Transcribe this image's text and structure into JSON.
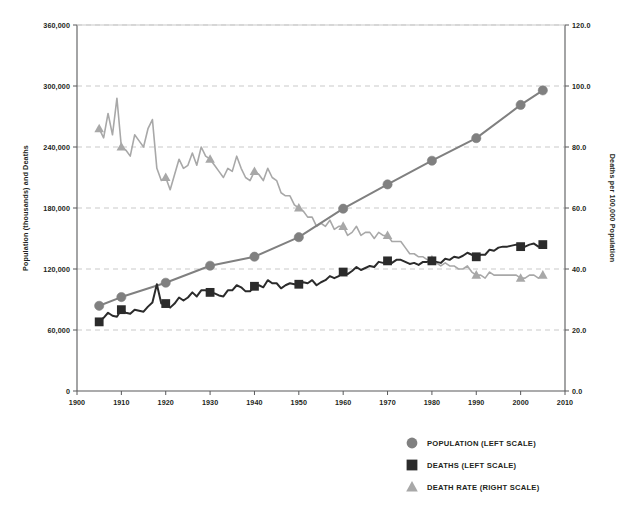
{
  "figure": {
    "title_fragment": "",
    "background": "#ffffff"
  },
  "colors": {
    "population": "#808080",
    "deaths": "#2b2b2b",
    "death_rate": "#a8a8a8",
    "grid": "#c9c9c9",
    "axis": "#58595b",
    "text": "#231f20"
  },
  "axes": {
    "left": {
      "title": "Population (thousands) and Deaths",
      "ticks": [
        "0",
        "60,000",
        "120,000",
        "180,000",
        "240,000",
        "300,000",
        "360,000"
      ],
      "min": 0,
      "max": 360000
    },
    "right": {
      "title": "Deaths per 100,000 Population",
      "ticks": [
        "0.0",
        "20.0",
        "40.0",
        "60.0",
        "80.0",
        "100.0",
        "120.0"
      ],
      "min": 0,
      "max": 120
    },
    "bottom": {
      "title": "",
      "ticks": [
        "1900",
        "1910",
        "1920",
        "1930",
        "1940",
        "1950",
        "1960",
        "1970",
        "1980",
        "1990",
        "2000",
        "2010"
      ],
      "min": 1900,
      "max": 2010
    }
  },
  "legend": {
    "items": [
      {
        "label": "POPULATION (LEFT SCALE)",
        "marker": "circle-marker",
        "color": "#808080"
      },
      {
        "label": "DEATHS (LEFT SCALE)",
        "marker": "square-marker",
        "color": "#2b2b2b"
      },
      {
        "label": "DEATH RATE (RIGHT SCALE)",
        "marker": "triangle-marker",
        "color": "#a8a8a8"
      }
    ]
  },
  "chart_data": {
    "type": "line",
    "title": "",
    "xlabel": "",
    "ylabel": "Population (thousands) and Deaths",
    "y2label": "Deaths per 100,000 Population",
    "xlim": [
      1900,
      2010
    ],
    "ylim": [
      0,
      360000
    ],
    "y2lim": [
      0,
      120
    ],
    "grid": true,
    "legend_position": "bottom-right",
    "marker_years": [
      1905,
      1910,
      1920,
      1930,
      1940,
      1950,
      1960,
      1970,
      1980,
      1990,
      2000,
      2005
    ],
    "series": [
      {
        "name": "POPULATION (LEFT SCALE)",
        "axis": "left",
        "units": "thousands",
        "marker": "circle-marker",
        "color": "#808080",
        "x": [
          1905,
          1910,
          1920,
          1930,
          1940,
          1950,
          1960,
          1970,
          1980,
          1990,
          2000,
          2005
        ],
        "values": [
          83800,
          92400,
          106500,
          123200,
          132100,
          151300,
          179300,
          203200,
          226500,
          248700,
          281400,
          295700
        ]
      },
      {
        "name": "DEATHS (LEFT SCALE)",
        "axis": "left",
        "units": "deaths",
        "marker": "square-marker",
        "color": "#2b2b2b",
        "x": [
          1905,
          1906,
          1907,
          1908,
          1909,
          1910,
          1911,
          1912,
          1913,
          1914,
          1915,
          1916,
          1917,
          1918,
          1919,
          1920,
          1921,
          1922,
          1923,
          1924,
          1925,
          1926,
          1927,
          1928,
          1929,
          1930,
          1931,
          1932,
          1933,
          1934,
          1935,
          1936,
          1937,
          1938,
          1939,
          1940,
          1941,
          1942,
          1943,
          1944,
          1945,
          1946,
          1947,
          1948,
          1949,
          1950,
          1951,
          1952,
          1953,
          1954,
          1955,
          1956,
          1957,
          1958,
          1959,
          1960,
          1961,
          1962,
          1963,
          1964,
          1965,
          1966,
          1967,
          1968,
          1969,
          1970,
          1971,
          1972,
          1973,
          1974,
          1975,
          1976,
          1977,
          1978,
          1979,
          1980,
          1981,
          1982,
          1983,
          1984,
          1985,
          1986,
          1987,
          1988,
          1989,
          1990,
          1991,
          1992,
          1993,
          1994,
          1995,
          1996,
          1997,
          1998,
          1999,
          2000,
          2001,
          2002,
          2003,
          2004,
          2005
        ],
        "values": [
          68000,
          72000,
          77000,
          74000,
          73000,
          80000,
          77000,
          76000,
          80000,
          79000,
          78000,
          83000,
          87000,
          105000,
          86000,
          86000,
          82000,
          86000,
          92000,
          89000,
          92000,
          97000,
          93000,
          99000,
          99000,
          97000,
          96000,
          94000,
          93000,
          99000,
          99000,
          104000,
          102000,
          98000,
          98000,
          103000,
          104000,
          102000,
          109000,
          106000,
          106000,
          101000,
          104000,
          106000,
          105000,
          105000,
          107000,
          106000,
          109000,
          104000,
          107000,
          109000,
          113000,
          111000,
          113000,
          117000,
          115000,
          118000,
          122000,
          119000,
          121000,
          123000,
          122000,
          127000,
          126000,
          128000,
          126000,
          129000,
          129000,
          127000,
          125000,
          126000,
          124000,
          127000,
          127000,
          128000,
          127000,
          126000,
          130000,
          129000,
          132000,
          131000,
          133000,
          136000,
          134000,
          132000,
          134000,
          134000,
          139000,
          138000,
          141000,
          142000,
          142000,
          143000,
          144000,
          142000,
          142000,
          144000,
          145000,
          142000,
          144000
        ]
      },
      {
        "name": "DEATH RATE (RIGHT SCALE)",
        "axis": "right",
        "units": "deaths per 100,000 population",
        "marker": "triangle-marker",
        "color": "#a8a8a8",
        "x": [
          1905,
          1906,
          1907,
          1908,
          1909,
          1910,
          1911,
          1912,
          1913,
          1914,
          1915,
          1916,
          1917,
          1918,
          1919,
          1920,
          1921,
          1922,
          1923,
          1924,
          1925,
          1926,
          1927,
          1928,
          1929,
          1930,
          1931,
          1932,
          1933,
          1934,
          1935,
          1936,
          1937,
          1938,
          1939,
          1940,
          1941,
          1942,
          1943,
          1944,
          1945,
          1946,
          1947,
          1948,
          1949,
          1950,
          1951,
          1952,
          1953,
          1954,
          1955,
          1956,
          1957,
          1958,
          1959,
          1960,
          1961,
          1962,
          1963,
          1964,
          1965,
          1966,
          1967,
          1968,
          1969,
          1970,
          1971,
          1972,
          1973,
          1974,
          1975,
          1976,
          1977,
          1978,
          1979,
          1980,
          1981,
          1982,
          1983,
          1984,
          1985,
          1986,
          1987,
          1988,
          1989,
          1990,
          1991,
          1992,
          1993,
          1994,
          1995,
          1996,
          1997,
          1998,
          1999,
          2000,
          2001,
          2002,
          2003,
          2004,
          2005
        ],
        "values": [
          86.0,
          83.0,
          91.0,
          84.0,
          96.0,
          80.0,
          79.0,
          77.0,
          84.0,
          82.0,
          80.0,
          86.0,
          89.0,
          73.0,
          69.0,
          70.0,
          66.0,
          71.0,
          76.0,
          73.0,
          74.0,
          78.0,
          74.0,
          80.0,
          77.0,
          76.0,
          74.0,
          72.0,
          70.0,
          73.0,
          72.0,
          77.0,
          73.0,
          70.0,
          69.0,
          72.0,
          71.0,
          69.0,
          73.0,
          70.0,
          69.0,
          65.0,
          64.0,
          64.0,
          61.0,
          60.0,
          59.0,
          57.0,
          57.0,
          54.0,
          55.0,
          54.0,
          56.0,
          53.0,
          54.0,
          54.0,
          51.0,
          52.0,
          54.0,
          51.0,
          52.0,
          52.0,
          50.0,
          52.0,
          51.0,
          51.0,
          49.0,
          49.0,
          49.0,
          47.0,
          45.0,
          45.0,
          44.0,
          44.0,
          43.0,
          43.0,
          42.0,
          41.0,
          42.0,
          41.0,
          41.0,
          40.0,
          40.0,
          41.0,
          39.0,
          38.0,
          38.0,
          37.0,
          39.0,
          38.0,
          38.0,
          38.0,
          38.0,
          38.0,
          38.0,
          37.0,
          37.0,
          38.0,
          38.0,
          37.0,
          38.0
        ]
      }
    ]
  }
}
